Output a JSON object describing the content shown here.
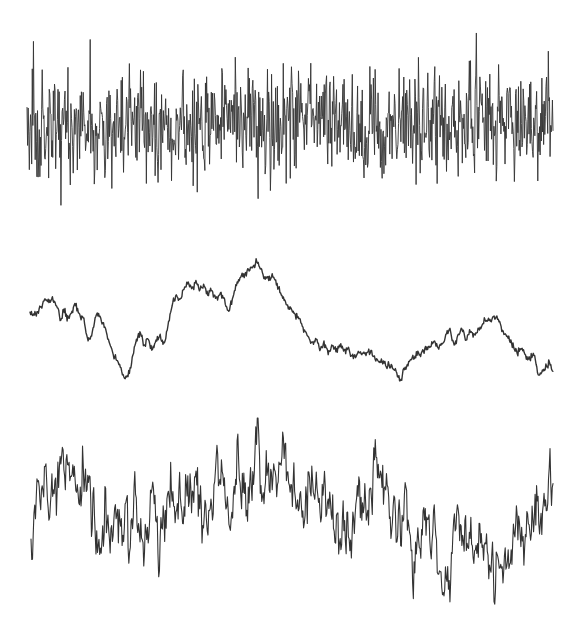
{
  "figure": {
    "width": 579,
    "height": 626,
    "background": "#ffffff",
    "line_color": "#333333"
  },
  "chart_data": [
    {
      "type": "line",
      "name": "white-noise",
      "title": "",
      "xlabel": "",
      "ylabel": "",
      "grid": false,
      "legend": "none",
      "description": "Uncorrelated high-frequency noise, dense vertical spikes",
      "x_range": [
        27,
        553
      ],
      "center_y": 125,
      "spike_extent_y": [
        30,
        215
      ],
      "typical_band_y": [
        75,
        180
      ],
      "samples": 900,
      "seed": 11,
      "stroke_width": 0.9
    },
    {
      "type": "line",
      "name": "random-walk",
      "title": "",
      "xlabel": "",
      "ylabel": "",
      "grid": false,
      "legend": "none",
      "description": "Brownian / integrated noise, smooth wandering trace",
      "x_range": [
        30,
        553
      ],
      "anchors": [
        [
          30,
          315
        ],
        [
          36,
          314
        ],
        [
          42,
          305
        ],
        [
          46,
          297
        ],
        [
          50,
          302
        ],
        [
          54,
          300
        ],
        [
          58,
          310
        ],
        [
          61,
          322
        ],
        [
          64,
          308
        ],
        [
          68,
          320
        ],
        [
          72,
          312
        ],
        [
          76,
          304
        ],
        [
          80,
          315
        ],
        [
          84,
          320
        ],
        [
          88,
          340
        ],
        [
          92,
          335
        ],
        [
          95,
          318
        ],
        [
          98,
          312
        ],
        [
          102,
          322
        ],
        [
          106,
          330
        ],
        [
          110,
          345
        ],
        [
          114,
          355
        ],
        [
          120,
          365
        ],
        [
          125,
          378
        ],
        [
          128,
          376
        ],
        [
          132,
          360
        ],
        [
          136,
          340
        ],
        [
          140,
          333
        ],
        [
          144,
          345
        ],
        [
          148,
          338
        ],
        [
          152,
          350
        ],
        [
          156,
          340
        ],
        [
          160,
          336
        ],
        [
          164,
          345
        ],
        [
          168,
          325
        ],
        [
          172,
          303
        ],
        [
          176,
          297
        ],
        [
          180,
          300
        ],
        [
          184,
          290
        ],
        [
          188,
          283
        ],
        [
          192,
          288
        ],
        [
          196,
          282
        ],
        [
          200,
          290
        ],
        [
          204,
          283
        ],
        [
          208,
          295
        ],
        [
          212,
          290
        ],
        [
          216,
          300
        ],
        [
          220,
          295
        ],
        [
          224,
          298
        ],
        [
          228,
          312
        ],
        [
          232,
          300
        ],
        [
          236,
          285
        ],
        [
          240,
          278
        ],
        [
          244,
          275
        ],
        [
          248,
          270
        ],
        [
          252,
          268
        ],
        [
          256,
          262
        ],
        [
          260,
          266
        ],
        [
          264,
          278
        ],
        [
          268,
          278
        ],
        [
          272,
          276
        ],
        [
          276,
          280
        ],
        [
          280,
          292
        ],
        [
          284,
          300
        ],
        [
          288,
          306
        ],
        [
          292,
          310
        ],
        [
          296,
          316
        ],
        [
          300,
          320
        ],
        [
          304,
          330
        ],
        [
          308,
          336
        ],
        [
          312,
          345
        ],
        [
          316,
          340
        ],
        [
          320,
          348
        ],
        [
          324,
          343
        ],
        [
          328,
          352
        ],
        [
          332,
          346
        ],
        [
          336,
          350
        ],
        [
          340,
          345
        ],
        [
          344,
          352
        ],
        [
          348,
          348
        ],
        [
          352,
          356
        ],
        [
          356,
          355
        ],
        [
          360,
          352
        ],
        [
          364,
          355
        ],
        [
          368,
          350
        ],
        [
          372,
          355
        ],
        [
          376,
          360
        ],
        [
          380,
          362
        ],
        [
          384,
          362
        ],
        [
          388,
          365
        ],
        [
          392,
          368
        ],
        [
          396,
          372
        ],
        [
          400,
          382
        ],
        [
          403,
          370
        ],
        [
          406,
          368
        ],
        [
          410,
          360
        ],
        [
          414,
          358
        ],
        [
          418,
          354
        ],
        [
          422,
          352
        ],
        [
          426,
          348
        ],
        [
          430,
          346
        ],
        [
          434,
          342
        ],
        [
          438,
          348
        ],
        [
          442,
          344
        ],
        [
          446,
          335
        ],
        [
          450,
          330
        ],
        [
          454,
          346
        ],
        [
          458,
          336
        ],
        [
          462,
          330
        ],
        [
          466,
          340
        ],
        [
          470,
          332
        ],
        [
          474,
          335
        ],
        [
          478,
          330
        ],
        [
          482,
          325
        ],
        [
          486,
          318
        ],
        [
          490,
          322
        ],
        [
          494,
          316
        ],
        [
          498,
          318
        ],
        [
          502,
          330
        ],
        [
          506,
          336
        ],
        [
          510,
          340
        ],
        [
          514,
          348
        ],
        [
          518,
          352
        ],
        [
          522,
          350
        ],
        [
          526,
          356
        ],
        [
          530,
          360
        ],
        [
          534,
          354
        ],
        [
          538,
          374
        ],
        [
          542,
          372
        ],
        [
          546,
          368
        ],
        [
          549,
          362
        ],
        [
          553,
          370
        ]
      ],
      "jitter": 1.6,
      "seed": 23,
      "stroke_width": 1.4
    },
    {
      "type": "line",
      "name": "pink-noise",
      "title": "",
      "xlabel": "",
      "ylabel": "",
      "grid": false,
      "legend": "none",
      "description": "1/f (pink) noise: mid-frequency fluctuations around a slowly varying trend",
      "x_range": [
        31,
        553
      ],
      "trend": [
        [
          31,
          540
        ],
        [
          40,
          500
        ],
        [
          55,
          495
        ],
        [
          70,
          490
        ],
        [
          85,
          500
        ],
        [
          100,
          520
        ],
        [
          120,
          530
        ],
        [
          140,
          530
        ],
        [
          150,
          510
        ],
        [
          165,
          505
        ],
        [
          180,
          480
        ],
        [
          195,
          505
        ],
        [
          210,
          530
        ],
        [
          220,
          500
        ],
        [
          235,
          490
        ],
        [
          255,
          488
        ],
        [
          270,
          495
        ],
        [
          285,
          470
        ],
        [
          300,
          490
        ],
        [
          315,
          495
        ],
        [
          330,
          510
        ],
        [
          345,
          530
        ],
        [
          360,
          505
        ],
        [
          375,
          480
        ],
        [
          390,
          482
        ],
        [
          405,
          500
        ],
        [
          420,
          540
        ],
        [
          440,
          560
        ],
        [
          455,
          545
        ],
        [
          470,
          540
        ],
        [
          485,
          555
        ],
        [
          500,
          560
        ],
        [
          515,
          535
        ],
        [
          530,
          515
        ],
        [
          545,
          510
        ],
        [
          553,
          490
        ]
      ],
      "noise_amplitude": 26,
      "extent_y": [
        418,
        610
      ],
      "samples": 700,
      "seed": 37,
      "stroke_width": 1.1
    }
  ],
  "labels": {
    "signal_1": "white-noise trace",
    "signal_2": "random-walk trace",
    "signal_3": "pink-noise trace"
  }
}
